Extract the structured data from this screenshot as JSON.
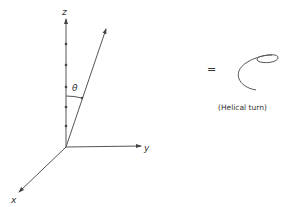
{
  "diagram": {
    "axes": {
      "z_label": "z",
      "y_label": "y",
      "x_label": "x"
    },
    "angle_label": "θ",
    "equals": "=",
    "helix_caption": "(Helical turn)",
    "colors": {
      "line": "#555555",
      "text": "#333333",
      "background": "#ffffff"
    }
  }
}
